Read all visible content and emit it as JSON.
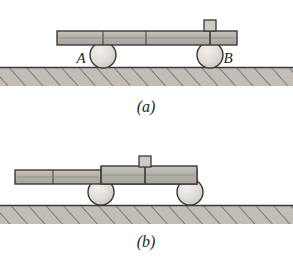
{
  "figure": {
    "colors": {
      "plank_fill": "#b9b5ad",
      "plank_stroke": "#3a3a3a",
      "cylinder_fill": "#dedad4",
      "cylinder_stroke": "#3a3a3a",
      "ground_fill": "#c2beb6",
      "ground_stroke": "#3a3a3a",
      "hatch_stroke": "#6e6a64",
      "block_fill": "#cfcbc4",
      "block_stroke": "#3a3a3a",
      "text": "#262626",
      "background": "#ffffff"
    },
    "panels": [
      {
        "id": "a",
        "caption": "(a)",
        "caption_x": 146,
        "caption_y": 112,
        "plank": {
          "x": 57,
          "y": 31,
          "width": 180,
          "height": 14,
          "dividers": [
            103,
            146,
            210
          ]
        },
        "ground": {
          "x": 0,
          "y": 67,
          "width": 293,
          "height": 19
        },
        "cylinders": [
          {
            "label": "A",
            "cx": 103,
            "cy": 55,
            "r": 13,
            "label_x": 81,
            "label_y": 63
          },
          {
            "label": "B",
            "cx": 210,
            "cy": 55,
            "r": 13,
            "label_x": 228,
            "label_y": 63
          }
        ],
        "block": {
          "x": 204,
          "y": 20,
          "width": 12,
          "height": 11,
          "stem_x": 210,
          "stem_y1": 31,
          "stem_y2": 45
        }
      },
      {
        "id": "b",
        "caption": "(b)",
        "caption_x": 146,
        "caption_y": 247,
        "plank": {
          "x": 15,
          "y": 170,
          "width": 182,
          "height": 14,
          "dividers": [
            53,
            101,
            145
          ],
          "step_x": 101,
          "step_y": 166,
          "step_width": 96,
          "step_height": 18
        },
        "ground": {
          "x": 0,
          "y": 205,
          "width": 293,
          "height": 19
        },
        "cylinders": [
          {
            "label": "",
            "cx": 101,
            "cy": 192,
            "r": 13,
            "label_x": 0,
            "label_y": 0
          },
          {
            "label": "",
            "cx": 190,
            "cy": 192,
            "r": 13,
            "label_x": 0,
            "label_y": 0
          }
        ],
        "block": {
          "x": 139,
          "y": 156,
          "width": 12,
          "height": 11,
          "stem_x": 145,
          "stem_y1": 166,
          "stem_y2": 184
        }
      }
    ]
  }
}
